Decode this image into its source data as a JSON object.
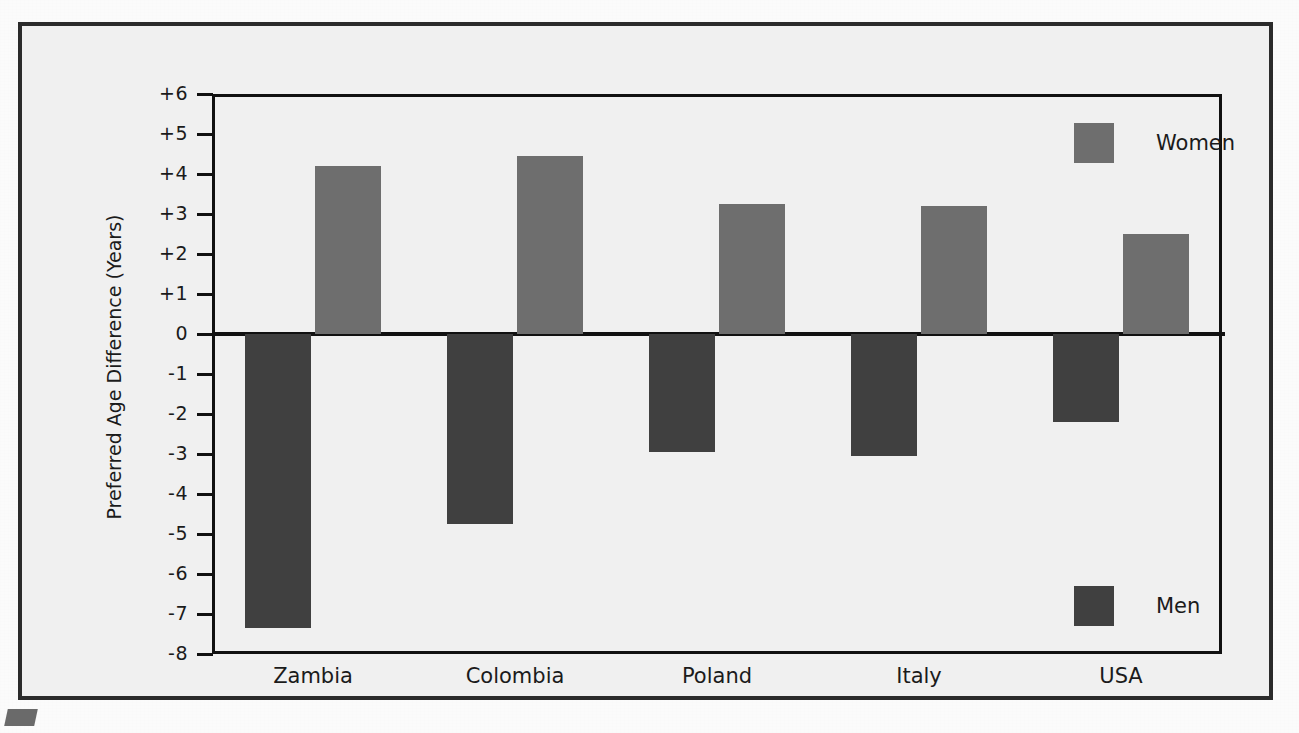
{
  "figure": {
    "background_color": "#f0f0f0",
    "frame_color": "#2b2b2b"
  },
  "chart_data": {
    "type": "bar",
    "title": "",
    "subtitle": "",
    "xlabel": "",
    "ylabel": "Preferred Age Difference (Years)",
    "categories": [
      "Zambia",
      "Colombia",
      "Poland",
      "Italy",
      "USA"
    ],
    "series": [
      {
        "name": "Women",
        "color": "#6e6e6e",
        "values": [
          4.2,
          4.45,
          3.25,
          3.2,
          2.5
        ]
      },
      {
        "name": "Men",
        "color": "#404040",
        "values": [
          -7.35,
          -4.75,
          -2.95,
          -3.05,
          -2.2
        ]
      }
    ],
    "ylim": [
      -8,
      6
    ],
    "yticks": [
      6,
      5,
      4,
      3,
      2,
      1,
      0,
      -1,
      -2,
      -3,
      -4,
      -5,
      -6,
      -7,
      -8
    ],
    "ytick_labels": [
      "+6",
      "+5",
      "+4",
      "+3",
      "+2",
      "+1",
      "0",
      "-1",
      "-2",
      "-3",
      "-4",
      "-5",
      "-6",
      "-7",
      "-8"
    ],
    "grid": false,
    "legend_position": "inside-right",
    "legend": [
      {
        "label": "Women",
        "color": "#6e6e6e"
      },
      {
        "label": "Men",
        "color": "#404040"
      }
    ],
    "zero_reference_line": 0
  }
}
